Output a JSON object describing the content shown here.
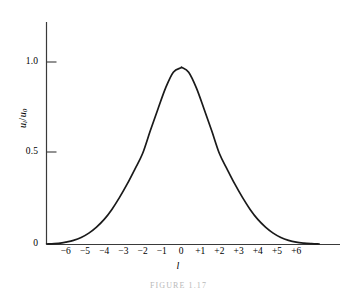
{
  "figure": {
    "caption": "FIGURE 1.17",
    "background_color": "#ffffff",
    "line_color": "#1a1a1a",
    "axis_color": "#3a3a3a"
  },
  "axes": {
    "y": {
      "title_numerator": "u",
      "title_numerator_sub": "l",
      "title_slash": "/",
      "title_denominator": "u",
      "title_denominator_sub": "0",
      "ticks": [
        {
          "value": 0,
          "label": "0"
        },
        {
          "value": 0.5,
          "label": "0.5"
        },
        {
          "value": 1.0,
          "label": "1.0"
        }
      ]
    },
    "x": {
      "title": "l",
      "ticks": [
        {
          "value": -6,
          "label": "−6"
        },
        {
          "value": -5,
          "label": "−5"
        },
        {
          "value": -4,
          "label": "−4"
        },
        {
          "value": -3,
          "label": "−3"
        },
        {
          "value": -2,
          "label": "−2"
        },
        {
          "value": -1,
          "label": "−1"
        },
        {
          "value": 0,
          "label": "0"
        },
        {
          "value": 1,
          "label": "+1"
        },
        {
          "value": 2,
          "label": "+2"
        },
        {
          "value": 3,
          "label": "+3"
        },
        {
          "value": 4,
          "label": "+4"
        },
        {
          "value": 5,
          "label": "+5"
        },
        {
          "value": 6,
          "label": "+6"
        }
      ]
    }
  },
  "chart_data": {
    "type": "line",
    "title": "FIGURE 1.17",
    "xlabel": "l",
    "ylabel": "u_l/u_0",
    "xlim": [
      -7.2,
      7.6
    ],
    "ylim": [
      0,
      1.18
    ],
    "grid": false,
    "legend": null,
    "xticks": [
      -6,
      -5,
      -4,
      -3,
      -2,
      -1,
      0,
      1,
      2,
      3,
      4,
      5,
      6
    ],
    "xticklabels": [
      "−6",
      "−5",
      "−4",
      "−3",
      "−2",
      "−1",
      "0",
      "+1",
      "+2",
      "+3",
      "+4",
      "+5",
      "+6"
    ],
    "yticks": [
      0,
      0.5,
      1.0
    ],
    "yticklabels": [
      "0",
      "0.5",
      "1.0"
    ],
    "series": [
      {
        "name": "u_l/u_0",
        "peak_value": 0.97,
        "peak_x": 0.05,
        "half_width_at_half_max": 2.0,
        "x": [
          -7.0,
          -6.6,
          -6.2,
          -6.0,
          -5.6,
          -5.2,
          -4.8,
          -4.4,
          -4.0,
          -3.6,
          -3.2,
          -2.8,
          -2.4,
          -2.0,
          -1.6,
          -1.2,
          -0.8,
          -0.4,
          0.0,
          0.05,
          0.4,
          0.8,
          1.2,
          1.6,
          2.0,
          2.4,
          2.8,
          3.2,
          3.6,
          4.0,
          4.4,
          4.8,
          5.2,
          5.6,
          6.0,
          6.4,
          6.8,
          7.2
        ],
        "y": [
          0.0,
          0.002,
          0.006,
          0.01,
          0.02,
          0.036,
          0.06,
          0.093,
          0.135,
          0.19,
          0.256,
          0.33,
          0.412,
          0.497,
          0.622,
          0.742,
          0.858,
          0.944,
          0.968,
          0.97,
          0.944,
          0.858,
          0.742,
          0.622,
          0.497,
          0.412,
          0.33,
          0.256,
          0.19,
          0.135,
          0.093,
          0.06,
          0.036,
          0.02,
          0.01,
          0.005,
          0.002,
          0.0
        ]
      }
    ]
  }
}
